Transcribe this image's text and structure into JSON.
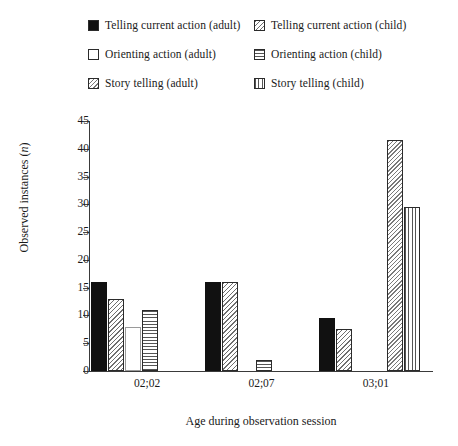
{
  "legend": {
    "entries": [
      {
        "label": "Telling current action (adult)",
        "pattern": "solid",
        "column": "left",
        "row": 0
      },
      {
        "label": "Telling current action (child)",
        "pattern": "diag-back",
        "column": "right",
        "row": 0
      },
      {
        "label": "Orienting action (adult)",
        "pattern": "empty",
        "column": "left",
        "row": 1
      },
      {
        "label": "Orienting action (child)",
        "pattern": "horiz",
        "column": "right",
        "row": 1
      },
      {
        "label": "Story telling (adult)",
        "pattern": "diag-dense",
        "column": "left",
        "row": 2
      },
      {
        "label": "Story telling (child)",
        "pattern": "vert",
        "column": "right",
        "row": 2
      }
    ]
  },
  "axes": {
    "y_title_text": "Observed instances (",
    "y_title_italic": "n",
    "y_title_tail": ")",
    "x_title": "Age during observation session",
    "y_ticks": [
      "0",
      "5",
      "10",
      "15",
      "20",
      "25",
      "30",
      "35",
      "40",
      "45"
    ]
  },
  "chart_data": {
    "type": "bar",
    "title": "",
    "xlabel": "Age during observation session",
    "ylabel": "Observed instances (n)",
    "ylim": [
      0,
      45
    ],
    "ytick_step": 5,
    "grid": false,
    "legend_position": "top",
    "categories": [
      "02;02",
      "02;07",
      "03;01"
    ],
    "series": [
      {
        "name": "Telling current action (adult)",
        "pattern": "solid",
        "values": [
          16,
          16,
          9.5
        ]
      },
      {
        "name": "Telling current action (child)",
        "pattern": "diag-back",
        "values": [
          13,
          16,
          7.5
        ]
      },
      {
        "name": "Orienting action (adult)",
        "pattern": "empty",
        "values": [
          8,
          0,
          0
        ]
      },
      {
        "name": "Orienting action (child)",
        "pattern": "horiz",
        "values": [
          11,
          2,
          0
        ]
      },
      {
        "name": "Story telling (adult)",
        "pattern": "diag-dense",
        "values": [
          0,
          0,
          41.5
        ]
      },
      {
        "name": "Story telling (child)",
        "pattern": "vert",
        "values": [
          0,
          0,
          29.5
        ]
      }
    ]
  }
}
